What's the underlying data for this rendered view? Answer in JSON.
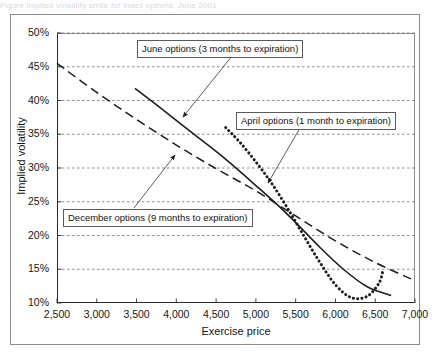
{
  "figure": {
    "top_caption_faint": "Figure   Implied volatility smile for index options, June 2001",
    "frame_label": "chart-frame"
  },
  "chart_data": {
    "type": "line",
    "title": "",
    "xlabel": "Exercise price",
    "ylabel": "Implied volatility",
    "xlim": [
      2500,
      7000
    ],
    "ylim": [
      0.1,
      0.5
    ],
    "xticks": [
      2500,
      3000,
      3500,
      4000,
      4500,
      5000,
      5500,
      6000,
      6500,
      7000
    ],
    "xticklabels": [
      "2,500",
      "3,000",
      "3,500",
      "4,000",
      "4,500",
      "5,000",
      "5,500",
      "6,000",
      "6,500",
      "7,000"
    ],
    "yticks": [
      0.1,
      0.15,
      0.2,
      0.25,
      0.3,
      0.35,
      0.4,
      0.45,
      0.5
    ],
    "yticklabels": [
      "10%",
      "15%",
      "20%",
      "25%",
      "30%",
      "35%",
      "40%",
      "45%",
      "50%"
    ],
    "grid": "horizontal-dashed",
    "legend": "annotated-callouts",
    "series": [
      {
        "name": "December options (9 months to expiration)",
        "style": "dashed",
        "x": [
          2500,
          3000,
          3500,
          4000,
          4500,
          5000,
          5500,
          6000,
          6500,
          7000
        ],
        "y": [
          0.455,
          0.412,
          0.372,
          0.334,
          0.299,
          0.266,
          0.229,
          0.192,
          0.16,
          0.133
        ]
      },
      {
        "name": "June options (3 months to expiration)",
        "style": "solid",
        "x": [
          3480,
          3800,
          4200,
          4600,
          5000,
          5400,
          5800,
          6100,
          6400,
          6700
        ],
        "y": [
          0.418,
          0.389,
          0.352,
          0.315,
          0.274,
          0.231,
          0.183,
          0.15,
          0.124,
          0.111
        ]
      },
      {
        "name": "April options (1 month to expiration)",
        "style": "dotted",
        "x": [
          4620,
          4800,
          5000,
          5200,
          5400,
          5600,
          5800,
          6000,
          6200,
          6400,
          6550,
          6600
        ],
        "y": [
          0.36,
          0.338,
          0.309,
          0.277,
          0.24,
          0.2,
          0.161,
          0.127,
          0.108,
          0.11,
          0.13,
          0.15
        ]
      }
    ],
    "annotations": [
      {
        "id": "june",
        "text": "June options (3 months to expiration)",
        "leader_from": [
          183,
          117
        ],
        "leader_to": [
          232,
          56
        ]
      },
      {
        "id": "april",
        "text": "April options (1 month to expiration)",
        "leader_from": [
          268,
          183
        ],
        "leader_to": [
          300,
          128
        ]
      },
      {
        "id": "december",
        "text": "December options (9 months to expiration)",
        "leader_from": [
          175,
          155
        ],
        "leader_to": [
          134,
          208
        ]
      }
    ]
  }
}
